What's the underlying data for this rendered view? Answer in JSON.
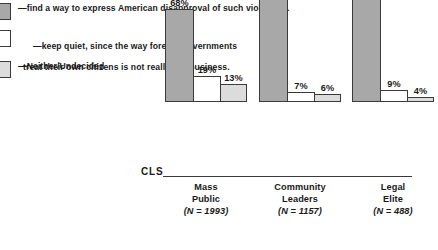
{
  "legend": {
    "items": [
      {
        "swatch": "dark-gray",
        "color": "#a8a8a8",
        "line1": "—find a way to express American disapproval of such violations.",
        "line2": ""
      },
      {
        "swatch": "white",
        "color": "#ffffff",
        "line1": "—keep quiet, since the way foreign governments",
        "line2": "treat their own citizens is not really our business."
      },
      {
        "swatch": "light-gray",
        "color": "#dcdcdc",
        "line1": "—Neither/Undecided",
        "line2": ""
      }
    ]
  },
  "axis": {
    "baseline_label": "CLS"
  },
  "chart_data": {
    "type": "bar",
    "title": "",
    "subtitle": "",
    "xlabel": "",
    "ylabel": "",
    "ylim": [
      0,
      100
    ],
    "grid": false,
    "legend_position": "top-left",
    "categories": [
      "Mass Public",
      "Community Leaders",
      "Legal Elite"
    ],
    "category_lines": [
      [
        "Mass",
        "Public"
      ],
      [
        "Community",
        "Leaders"
      ],
      [
        "Legal",
        "Elite"
      ]
    ],
    "sample_sizes": [
      "(N = 1993)",
      "(N = 1157)",
      "(N = 488)"
    ],
    "series": [
      {
        "name": "find a way to express American disapproval of such violations.",
        "color": "#a8a8a8",
        "values": [
          68,
          87,
          87
        ],
        "labels": [
          "68%",
          "87%",
          "87%"
        ]
      },
      {
        "name": "keep quiet, since the way foreign governments treat their own citizens is not really our business.",
        "color": "#ffffff",
        "values": [
          19,
          7,
          9
        ],
        "labels": [
          "19%",
          "7%",
          "9%"
        ]
      },
      {
        "name": "Neither/Undecided",
        "color": "#dcdcdc",
        "values": [
          13,
          6,
          4
        ],
        "labels": [
          "13%",
          "6%",
          "4%"
        ]
      }
    ]
  }
}
